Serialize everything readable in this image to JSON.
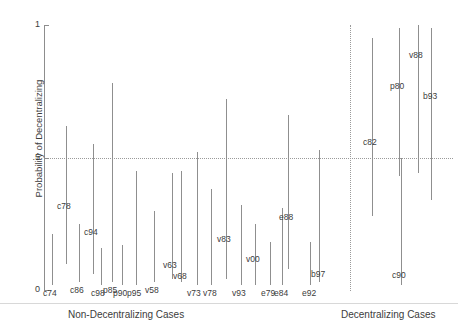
{
  "chart_data": {
    "type": "scatter",
    "title": "",
    "subtitle": "",
    "xlabel": "",
    "ylabel": "Probability of Decentralizing",
    "ylim": [
      0,
      1
    ],
    "yticks": [
      "0",
      ".5",
      "1"
    ],
    "ytick_values": [
      0,
      0.5,
      1
    ],
    "grid": false,
    "legend_position": "none",
    "reference_lines": [
      {
        "name": "half-probability-line",
        "orientation": "horizontal",
        "value": 0.5,
        "style": "dotted"
      },
      {
        "name": "group-separator-line",
        "orientation": "vertical",
        "style": "dotted"
      }
    ],
    "annotations": [
      {
        "name": "group-label-left",
        "text": "Non-Decentralizing Cases"
      },
      {
        "name": "group-label-right",
        "text": "Decentralizing Cases"
      }
    ],
    "groups": [
      {
        "name": "Non-Decentralizing Cases",
        "cases": [
          {
            "label": "c74",
            "x": 52,
            "low": 0.02,
            "high": 0.21
          },
          {
            "label": "c78",
            "x": 66,
            "low": 0.1,
            "high": 0.62
          },
          {
            "label": "c86",
            "x": 79,
            "low": 0.03,
            "high": 0.25
          },
          {
            "label": "c94",
            "x": 93,
            "low": 0.06,
            "high": 0.55
          },
          {
            "label": "c98",
            "x": 101,
            "low": 0.02,
            "high": 0.16
          },
          {
            "label": "p85",
            "x": 112,
            "low": 0.03,
            "high": 0.78
          },
          {
            "label": "p90",
            "x": 122,
            "low": 0.02,
            "high": 0.17
          },
          {
            "label": "p95",
            "x": 136,
            "low": 0.02,
            "high": 0.45
          },
          {
            "label": "v58",
            "x": 154,
            "low": 0.03,
            "high": 0.3
          },
          {
            "label": "v63",
            "x": 172,
            "low": 0.04,
            "high": 0.44
          },
          {
            "label": "v68",
            "x": 181,
            "low": 0.03,
            "high": 0.45
          },
          {
            "label": "v73",
            "x": 197,
            "low": 0.02,
            "high": 0.52
          },
          {
            "label": "v78",
            "x": 211,
            "low": 0.02,
            "high": 0.38
          },
          {
            "label": "v83",
            "x": 226,
            "low": 0.04,
            "high": 0.72
          },
          {
            "label": "v93",
            "x": 241,
            "low": 0.02,
            "high": 0.32
          },
          {
            "label": "v00",
            "x": 255,
            "low": 0.02,
            "high": 0.25
          },
          {
            "label": "e79",
            "x": 270,
            "low": 0.02,
            "high": 0.18
          },
          {
            "label": "e84",
            "x": 282,
            "low": 0.02,
            "high": 0.31
          },
          {
            "label": "e88",
            "x": 288,
            "low": 0.08,
            "high": 0.66
          },
          {
            "label": "e92",
            "x": 310,
            "low": 0.02,
            "high": 0.18
          },
          {
            "label": "b97",
            "x": 319,
            "low": 0.03,
            "high": 0.53
          }
        ]
      },
      {
        "name": "Decentralizing Cases",
        "cases": [
          {
            "label": "c82",
            "x": 372,
            "low": 0.28,
            "high": 0.95
          },
          {
            "label": "p80",
            "x": 399,
            "low": 0.43,
            "high": 0.99
          },
          {
            "label": "v88",
            "x": 418,
            "low": 0.44,
            "high": 1.0
          },
          {
            "label": "b93",
            "x": 431,
            "low": 0.34,
            "high": 0.99
          },
          {
            "label": "c90",
            "x": 401,
            "low": 0.02,
            "high": 0.5
          }
        ]
      }
    ]
  },
  "yaxis": {
    "title": "Probability of Decentralizing",
    "ticks": [
      {
        "label": "1",
        "value": 1
      },
      {
        "label": ".5",
        "value": 0.5
      },
      {
        "label": "0",
        "value": 0
      }
    ]
  },
  "xaxis": {
    "group_labels": [
      {
        "text": "Non-Decentralizing Cases"
      },
      {
        "text": "Decentralizing Cases"
      }
    ]
  }
}
